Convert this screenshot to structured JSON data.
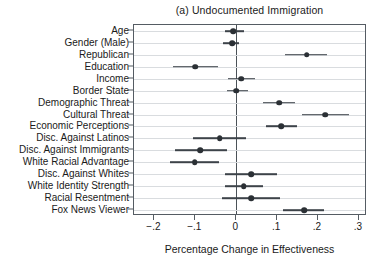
{
  "chart_data": {
    "type": "scatter",
    "title": "(a) Undocumented Immigration",
    "xlabel": "Percentage Change in Effectiveness",
    "ylabel": "",
    "xlim": [
      -0.25,
      0.32
    ],
    "xticks": [
      -0.2,
      -0.1,
      0,
      0.1,
      0.2,
      0.3
    ],
    "xtick_labels": [
      "−.2",
      "−.1",
      "0",
      ".1",
      ".2",
      ".3"
    ],
    "grid": true,
    "legend": "none",
    "reference_line": 0,
    "categories": [
      "Age",
      "Gender (Male)",
      "Republican",
      "Education",
      "Income",
      "Border State",
      "Demographic Threat",
      "Cultural Threat",
      "Economic Perceptions",
      "Disc. Against Latinos",
      "Disc. Against Immigrants",
      "White Racial Advantage",
      "Disc. Against Whites",
      "White Identity Strength",
      "Racial Resentment",
      "Fox News Viewer"
    ],
    "points": [
      {
        "label": "Age",
        "estimate": -0.008,
        "ci_low": -0.028,
        "ci_high": 0.018
      },
      {
        "label": "Gender (Male)",
        "estimate": -0.01,
        "ci_low": -0.032,
        "ci_high": 0.006
      },
      {
        "label": "Republican",
        "estimate": 0.172,
        "ci_low": 0.12,
        "ci_high": 0.222
      },
      {
        "label": "Education",
        "estimate": -0.1,
        "ci_low": -0.155,
        "ci_high": -0.045
      },
      {
        "label": "Income",
        "estimate": 0.012,
        "ci_low": -0.02,
        "ci_high": 0.045
      },
      {
        "label": "Border State",
        "estimate": 0.0,
        "ci_low": -0.022,
        "ci_high": 0.028
      },
      {
        "label": "Demographic Threat",
        "estimate": 0.105,
        "ci_low": 0.065,
        "ci_high": 0.145
      },
      {
        "label": "Cultural Threat",
        "estimate": 0.218,
        "ci_low": 0.16,
        "ci_high": 0.275
      },
      {
        "label": "Economic Perceptions",
        "estimate": 0.11,
        "ci_low": 0.072,
        "ci_high": 0.148
      },
      {
        "label": "Disc. Against Latinos",
        "estimate": -0.04,
        "ci_low": -0.105,
        "ci_high": 0.025
      },
      {
        "label": "Disc. Against Immigrants",
        "estimate": -0.088,
        "ci_low": -0.15,
        "ci_high": -0.022
      },
      {
        "label": "White Racial Advantage",
        "estimate": -0.102,
        "ci_low": -0.162,
        "ci_high": -0.042
      },
      {
        "label": "Disc. Against Whites",
        "estimate": 0.036,
        "ci_low": -0.028,
        "ci_high": 0.1
      },
      {
        "label": "White Identity Strength",
        "estimate": 0.018,
        "ci_low": -0.028,
        "ci_high": 0.065
      },
      {
        "label": "Racial Resentment",
        "estimate": 0.036,
        "ci_low": -0.035,
        "ci_high": 0.108
      },
      {
        "label": "Fox News Viewer",
        "estimate": 0.166,
        "ci_low": 0.115,
        "ci_high": 0.215
      }
    ],
    "colors": {
      "point": "#2b3035",
      "interval": "#3d4349",
      "grid": "#d9dcdf",
      "frame": "#555c63",
      "reference": "#4b5258",
      "background": "#ffffff"
    }
  }
}
